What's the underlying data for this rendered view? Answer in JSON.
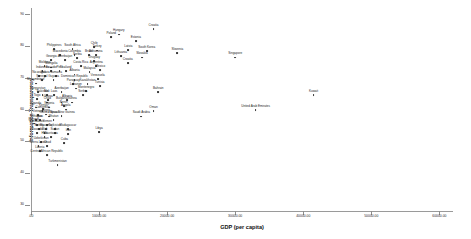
{
  "chart_data": {
    "type": "scatter",
    "title": "",
    "xlabel": "GDP (per capita)",
    "ylabel": "Information Transparency",
    "xlim": [
      0,
      62000
    ],
    "ylim": [
      28,
      92
    ],
    "grid": false,
    "legend": "none",
    "xticks": [
      ".00",
      "10000.00",
      "20000.00",
      "30000.00",
      "40000.00",
      "50000.00",
      "60000.00"
    ],
    "xtick_values": [
      0,
      10000,
      20000,
      30000,
      40000,
      50000,
      60000
    ],
    "yticks": [
      "90",
      "80",
      "70",
      "60",
      "50",
      "40",
      "30"
    ],
    "ytick_values": [
      90,
      80,
      70,
      60,
      50,
      40,
      30
    ],
    "points": [
      {
        "label": "Philippines",
        "x": 3400,
        "y": 79.0
      },
      {
        "label": "South Africa",
        "x": 6100,
        "y": 79.0
      },
      {
        "label": "Macedonia",
        "x": 4300,
        "y": 77.2
      },
      {
        "label": "Colombia",
        "x": 6400,
        "y": 77.2
      },
      {
        "label": "Georgia",
        "x": 3000,
        "y": 75.6
      },
      {
        "label": "Azerbaijan",
        "x": 5000,
        "y": 75.6
      },
      {
        "label": "Serbia",
        "x": 6800,
        "y": 76.2
      },
      {
        "label": "Brazil",
        "x": 8500,
        "y": 77.2
      },
      {
        "label": "Botswana",
        "x": 9500,
        "y": 77.2
      },
      {
        "label": "Uruguay",
        "x": 9300,
        "y": 75.2
      },
      {
        "label": "Chile",
        "x": 9300,
        "y": 79.8
      },
      {
        "label": "Turkey",
        "x": 9700,
        "y": 78.6
      },
      {
        "label": "Moldova",
        "x": 2000,
        "y": 73.6
      },
      {
        "label": "Mongolia",
        "x": 3000,
        "y": 73.2
      },
      {
        "label": "Costa Rica",
        "x": 7300,
        "y": 73.6
      },
      {
        "label": "Argentina",
        "x": 9600,
        "y": 73.6
      },
      {
        "label": "Indonesia",
        "x": 1700,
        "y": 72.2
      },
      {
        "label": "Ecuador",
        "x": 3000,
        "y": 72.2
      },
      {
        "label": "Peru",
        "x": 4200,
        "y": 72.2
      },
      {
        "label": "Thailand",
        "x": 5100,
        "y": 72.2
      },
      {
        "label": "Malaysia",
        "x": 8600,
        "y": 71.8
      },
      {
        "label": "Mexico",
        "x": 10200,
        "y": 72.4
      },
      {
        "label": "Nicaragua",
        "x": 1200,
        "y": 70.6
      },
      {
        "label": "Bolivia",
        "x": 2100,
        "y": 70.6
      },
      {
        "label": "Jamaica",
        "x": 3700,
        "y": 70.6
      },
      {
        "label": "Albania",
        "x": 6400,
        "y": 71.0
      },
      {
        "label": "Senegal",
        "x": 1600,
        "y": 69.4
      },
      {
        "label": "Guyana",
        "x": 3300,
        "y": 69.4
      },
      {
        "label": "Dominican Republic",
        "x": 6400,
        "y": 69.4
      },
      {
        "label": "Venezuela",
        "x": 9800,
        "y": 69.6
      },
      {
        "label": "Mozambique",
        "x": 700,
        "y": 68.2
      },
      {
        "label": "Paraguay",
        "x": 6200,
        "y": 68.0
      },
      {
        "label": "Kazakhstan",
        "x": 8300,
        "y": 68.0
      },
      {
        "label": "Tunisia",
        "x": 10100,
        "y": 67.4
      },
      {
        "label": "Lebanon",
        "x": 6600,
        "y": 66.6
      },
      {
        "label": "Kyrgyzstan",
        "x": 1000,
        "y": 65.6
      },
      {
        "label": "Azerbaijan",
        "x": 4500,
        "y": 65.6
      },
      {
        "label": "Montenegro",
        "x": 8100,
        "y": 65.8
      },
      {
        "label": "Pakistan",
        "x": 1700,
        "y": 64.6
      },
      {
        "label": "Mali",
        "x": 2300,
        "y": 64.6
      },
      {
        "label": "Serbia",
        "x": 7600,
        "y": 64.6
      },
      {
        "label": "Laos",
        "x": 3400,
        "y": 64.6
      },
      {
        "label": "Togo",
        "x": 900,
        "y": 63.4
      },
      {
        "label": "Ghana",
        "x": 2500,
        "y": 63.0
      },
      {
        "label": "Albania",
        "x": 5300,
        "y": 63.0
      },
      {
        "label": "Chad",
        "x": 2400,
        "y": 62.2
      },
      {
        "label": "Bulgaria",
        "x": 4500,
        "y": 62.2
      },
      {
        "label": "Guinea",
        "x": 6000,
        "y": 62.2
      },
      {
        "label": "Uganda",
        "x": 700,
        "y": 60.6
      },
      {
        "label": "Nigeria",
        "x": 2700,
        "y": 60.6
      },
      {
        "label": "Benin",
        "x": 4800,
        "y": 61.0
      },
      {
        "label": "Angola",
        "x": 5100,
        "y": 60.0
      },
      {
        "label": "Cameroon",
        "x": 1700,
        "y": 59.4
      },
      {
        "label": "Kenya",
        "x": 1800,
        "y": 60.2
      },
      {
        "label": "Vietnam",
        "x": 1000,
        "y": 58.2
      },
      {
        "label": "Niger",
        "x": 2200,
        "y": 58.4
      },
      {
        "label": "Guinea-Bissau",
        "x": 2700,
        "y": 57.8
      },
      {
        "label": "Papua New Guinea",
        "x": 4500,
        "y": 58.0
      },
      {
        "label": "Ethiopia",
        "x": 800,
        "y": 56.8
      },
      {
        "label": "Laos",
        "x": 1300,
        "y": 56.8
      },
      {
        "label": "Bhutan",
        "x": 3300,
        "y": 56.6
      },
      {
        "label": "Burundi",
        "x": 400,
        "y": 55.6
      },
      {
        "label": "Zimbabwe",
        "x": 900,
        "y": 55.0
      },
      {
        "label": "Yemen",
        "x": 2400,
        "y": 55.0
      },
      {
        "label": "Eritrea",
        "x": 1200,
        "y": 53.8
      },
      {
        "label": "Myanmar",
        "x": 2200,
        "y": 53.8
      },
      {
        "label": "Tajikistan",
        "x": 3500,
        "y": 53.8
      },
      {
        "label": "Madagascar",
        "x": 5400,
        "y": 53.8
      },
      {
        "label": "Rwanda",
        "x": 900,
        "y": 52.6
      },
      {
        "label": "Mali",
        "x": 2000,
        "y": 52.6
      },
      {
        "label": "Sudan",
        "x": 3500,
        "y": 52.6
      },
      {
        "label": "Iran",
        "x": 5500,
        "y": 52.2
      },
      {
        "label": "Libya",
        "x": 10000,
        "y": 52.8
      },
      {
        "label": "Haiti",
        "x": 2000,
        "y": 51.2
      },
      {
        "label": "Mauritania",
        "x": 2900,
        "y": 51.2
      },
      {
        "label": "Uzbekistan",
        "x": 1500,
        "y": 49.8
      },
      {
        "label": "Cuba",
        "x": 4900,
        "y": 49.4
      },
      {
        "label": "Sierra Leone",
        "x": 1100,
        "y": 48.4
      },
      {
        "label": "Chad",
        "x": 2400,
        "y": 48.4
      },
      {
        "label": "Liberia",
        "x": 1300,
        "y": 46.8
      },
      {
        "label": "Central African Republic",
        "x": 2300,
        "y": 45.6
      },
      {
        "label": "Turkmenistan",
        "x": 3900,
        "y": 42.4
      },
      {
        "label": "Hungary",
        "x": 12900,
        "y": 83.6
      },
      {
        "label": "Poland",
        "x": 11800,
        "y": 82.8
      },
      {
        "label": "Estonia",
        "x": 15400,
        "y": 81.6
      },
      {
        "label": "Croatia",
        "x": 18000,
        "y": 85.4
      },
      {
        "label": "Latvia",
        "x": 14300,
        "y": 78.8
      },
      {
        "label": "South Korea",
        "x": 17000,
        "y": 78.4
      },
      {
        "label": "Slovenia",
        "x": 21500,
        "y": 77.8
      },
      {
        "label": "Lithuania",
        "x": 13200,
        "y": 76.8
      },
      {
        "label": "Slovakia",
        "x": 16300,
        "y": 76.4
      },
      {
        "label": "Croatia",
        "x": 14200,
        "y": 74.6
      },
      {
        "label": "Singapore",
        "x": 30000,
        "y": 76.4
      },
      {
        "label": "Bahrain",
        "x": 18700,
        "y": 65.4
      },
      {
        "label": "Oman",
        "x": 18000,
        "y": 59.6
      },
      {
        "label": "Saudi Arabia",
        "x": 16200,
        "y": 57.8
      },
      {
        "label": "United Arab Emirates",
        "x": 33000,
        "y": 59.8
      },
      {
        "label": "Kuwait",
        "x": 41500,
        "y": 64.6
      }
    ]
  }
}
